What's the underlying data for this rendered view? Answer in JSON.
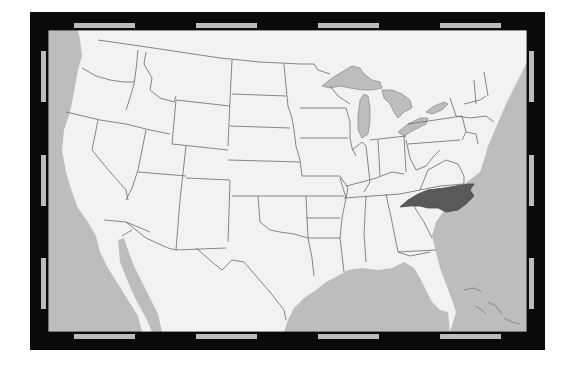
{
  "map": {
    "title": "United States locator map",
    "highlighted_region": "North Carolina",
    "projection_frame": "neatline with alternating black/gray graticule bars",
    "colors": {
      "background": "#ffffff",
      "land": "#f2f2f2",
      "water": "#bdbdbd",
      "border": "#6a6a6a",
      "highlight": "#595959",
      "frame_black": "#0a0a0a",
      "frame_gray": "#bcbcbc"
    },
    "regions": [
      "Washington",
      "Oregon",
      "California",
      "Idaho",
      "Nevada",
      "Montana",
      "Wyoming",
      "Utah",
      "Arizona",
      "Colorado",
      "New Mexico",
      "North Dakota",
      "South Dakota",
      "Nebraska",
      "Kansas",
      "Oklahoma",
      "Texas",
      "Minnesota",
      "Iowa",
      "Missouri",
      "Arkansas",
      "Louisiana",
      "Wisconsin",
      "Illinois",
      "Michigan",
      "Indiana",
      "Ohio",
      "Kentucky",
      "Tennessee",
      "Mississippi",
      "Alabama",
      "Georgia",
      "Florida",
      "South Carolina",
      "North Carolina",
      "Virginia",
      "West Virginia",
      "Pennsylvania",
      "New York",
      "Maryland",
      "Delaware",
      "New Jersey",
      "Connecticut",
      "Rhode Island",
      "Massachusetts",
      "Vermont",
      "New Hampshire",
      "Maine",
      "Mexico",
      "Canada"
    ],
    "water_bodies": [
      "Pacific Ocean",
      "Atlantic Ocean",
      "Gulf of Mexico",
      "Gulf of California",
      "Great Lakes"
    ]
  }
}
